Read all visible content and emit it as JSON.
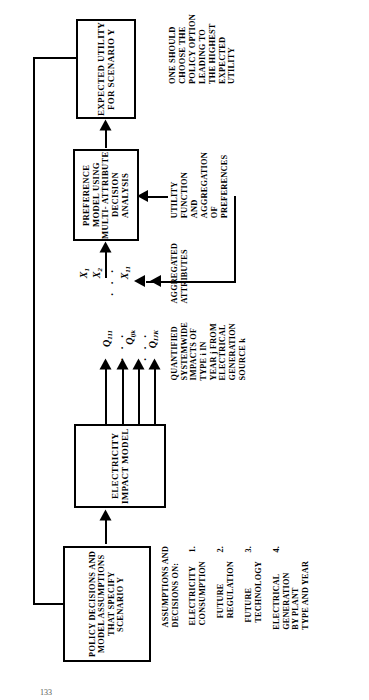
{
  "figure": {
    "orientation": "rotated-90-ccw",
    "boxes": [
      {
        "id": "expected-utility",
        "label": "EXPECTED\nUTILITY\nFOR\nSCENARIO Y"
      },
      {
        "id": "preference-model",
        "label": "PREFERENCE\nMODEL\nUSING\nMULTI-\nATTRIBUTE\nDECISION\nANALYSIS"
      },
      {
        "id": "electricity-impact-model",
        "label": "ELECTRICITY\nIMPACT\nMODEL"
      },
      {
        "id": "policy-decisions",
        "label": "POLICY DECISIONS\nAND MODEL\nASSUMPTIONS\nTHAT SPECIFY\nSCENARIO Y"
      }
    ],
    "annotations": [
      {
        "id": "choose-policy-note",
        "text": "ONE SHOULD\nCHOOSE THE\nPOLICY OPTION\nLEADING TO\nTHE HIGHEST\nEXPECTED\nUTILITY"
      },
      {
        "id": "utility-function-note",
        "text": "UTILITY\nFUNCTION\nAND\nAGGREGATION\nOF\nPREFERENCES"
      },
      {
        "id": "aggregated-attributes-note",
        "text": "AGGREGATED\nATTRIBUTES"
      },
      {
        "id": "quantified-impacts-note",
        "text": "QUANTIFIED\nSYSTEMWIDE\nIMPACTS OF\nTYPE i IN\nYEAR j FROM\nELECTRICAL\nGENERATION\nSOURCE k"
      },
      {
        "id": "assumptions-heading",
        "text": "ASSUMPTIONS AND\nDECISIONS ON:"
      }
    ],
    "assumptions_list": [
      {
        "num": "1.",
        "text": "ELECTRICITY\nCONSUMPTION"
      },
      {
        "num": "2.",
        "text": "FUTURE\nREGULATION"
      },
      {
        "num": "3.",
        "text": "FUTURE\nTECHNOLOGY"
      },
      {
        "num": "4.",
        "text": "ELECTRICAL\nGENERATION\nBY PLANT\nTYPE AND YEAR"
      }
    ],
    "attribute_labels": [
      {
        "base": "X",
        "sub": "1"
      },
      {
        "base": "X",
        "sub": "2"
      },
      {
        "base": "X",
        "sub": "11"
      }
    ],
    "quantity_labels": [
      {
        "base": "Q",
        "sub": "111"
      },
      {
        "base": "Q",
        "sub": "ijk"
      },
      {
        "base": "Q",
        "sub": "IJK"
      }
    ],
    "ellipsis": ". . .",
    "page_number": "133"
  }
}
